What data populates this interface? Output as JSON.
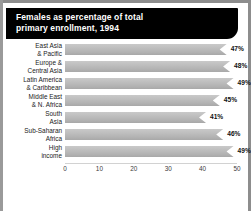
{
  "chart_data": {
    "type": "bar",
    "orientation": "horizontal",
    "title": "Females as percentage of total primary enrollment, 1994",
    "title_line1": "Females as percentage of total",
    "title_line2": "primary enrollment, 1994",
    "xlabel": "",
    "ylabel": "",
    "xlim": [
      0,
      50
    ],
    "grid": false,
    "legend": null,
    "bar_color": "#bdbdbd",
    "categories": [
      "East Asia & Pacific",
      "Europe & Central Asia",
      "Latin America & Caribbean",
      "Middle East & N. Africa",
      "South Asia",
      "Sub-Saharan Africa",
      "High income"
    ],
    "category_lines": [
      [
        "East Asia",
        "& Pacific"
      ],
      [
        "Europe &",
        "Central Asia"
      ],
      [
        "Latin America",
        "& Caribbean"
      ],
      [
        "Middle East",
        "& N. Africa"
      ],
      [
        "South",
        "Asia"
      ],
      [
        "Sub-Saharan",
        "Africa"
      ],
      [
        "High",
        "income"
      ]
    ],
    "values": [
      47,
      48,
      49,
      45,
      41,
      46,
      49
    ],
    "value_labels": [
      "47%",
      "48%",
      "49%",
      "45%",
      "41%",
      "46%",
      "49%"
    ],
    "ticks": [
      "0",
      "10",
      "20",
      "30",
      "40",
      "50"
    ],
    "tick_values": [
      0,
      10,
      20,
      30,
      40,
      50
    ]
  }
}
